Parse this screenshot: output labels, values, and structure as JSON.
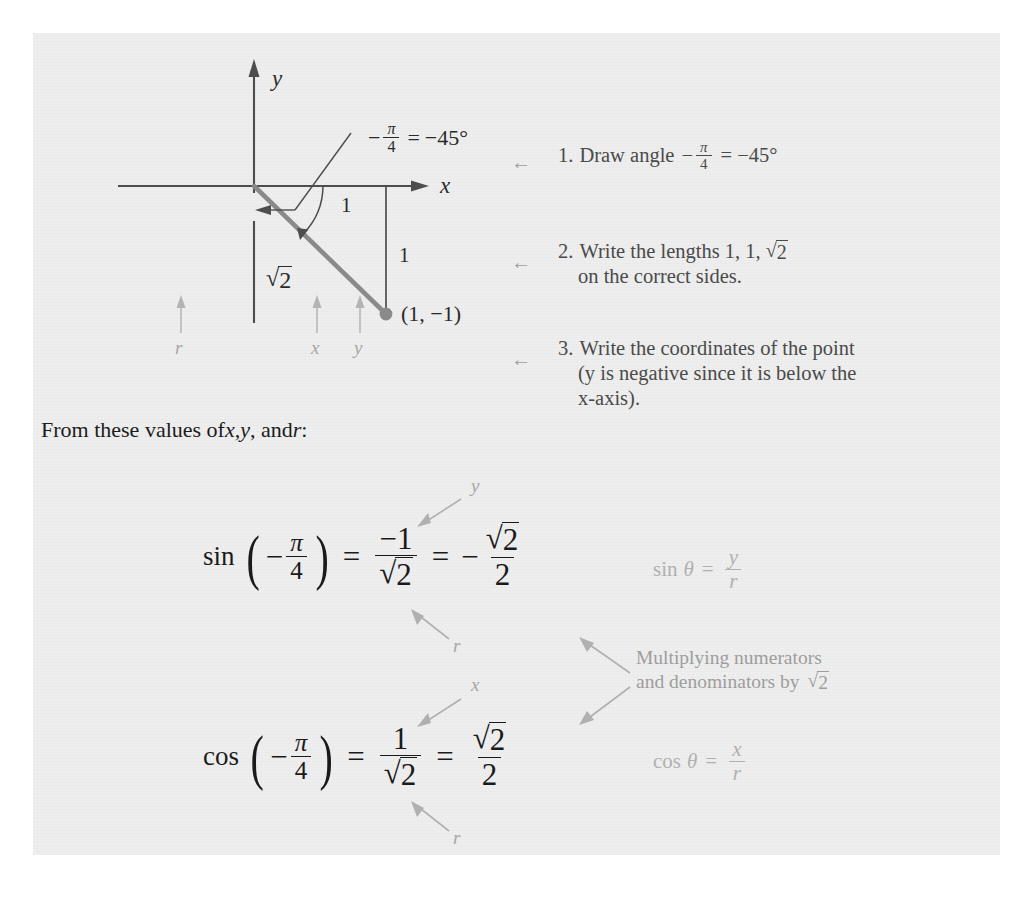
{
  "page": {
    "background_color": "#eeeeee",
    "ink_color": "#1c1c1c",
    "accent_gray": "#9d9d9d",
    "ray_color": "#8a8a8a"
  },
  "figure": {
    "axis_label_y": "y",
    "axis_label_x": "x",
    "angle_label": {
      "minus": "−",
      "numerator": "π",
      "denominator": "4",
      "equals": "=",
      "degrees": "−45°"
    },
    "side_label_top": "1",
    "side_label_right": "1",
    "hypotenuse_label": {
      "radical": "√",
      "radicand": "2"
    },
    "point_label": "(1, −1)",
    "component_labels": {
      "r": "r",
      "x": "x",
      "y": "y"
    }
  },
  "steps": [
    {
      "number": "1.",
      "text_before": "Draw angle",
      "has_fraction": true,
      "fraction": {
        "minus": "−",
        "numerator": "π",
        "denominator": "4"
      },
      "text_after": "= −45°",
      "line2": "",
      "arrow": "←"
    },
    {
      "number": "2.",
      "text_before": "Write the lengths 1, 1,",
      "has_fraction": false,
      "radical": {
        "radical": "√",
        "radicand": "2"
      },
      "text_after": "",
      "line2": "on the correct sides.",
      "arrow": "←"
    },
    {
      "number": "3.",
      "text_before": "Write the coordinates of the point",
      "has_fraction": false,
      "text_after": "",
      "line2": "(y is negative since it is below the",
      "line3": "x-axis).",
      "arrow": "←"
    }
  ],
  "lead_in_sentence": {
    "part1": "From these values of ",
    "var1": "x",
    "sep1": ", ",
    "var2": "y",
    "sep2": ", and ",
    "var3": "r",
    "part2": ":"
  },
  "equations": [
    {
      "id": "sine",
      "function": "sin",
      "open_paren": "(",
      "arg": {
        "minus": "−",
        "numerator": "π",
        "denominator": "4"
      },
      "close_paren": ")",
      "equals1": "=",
      "middle": {
        "numerator": "−1",
        "denominator_radical": "√",
        "denominator_radicand": "2"
      },
      "equals2": "=",
      "result": {
        "sign": "−",
        "numerator_radical": "√",
        "numerator_radicand": "2",
        "denominator": "2"
      },
      "callout_numerator": "y",
      "callout_denominator": "r",
      "identity": {
        "function": "sin",
        "theta": "θ",
        "equals": "=",
        "numerator": "y",
        "denominator": "r"
      }
    },
    {
      "id": "cosine",
      "function": "cos",
      "open_paren": "(",
      "arg": {
        "minus": "−",
        "numerator": "π",
        "denominator": "4"
      },
      "close_paren": ")",
      "equals1": "=",
      "middle": {
        "numerator": "1",
        "denominator_radical": "√",
        "denominator_radicand": "2"
      },
      "equals2": "=",
      "result": {
        "sign": "",
        "numerator_radical": "√",
        "numerator_radicand": "2",
        "denominator": "2"
      },
      "callout_numerator": "x",
      "callout_denominator": "r",
      "identity": {
        "function": "cos",
        "theta": "θ",
        "equals": "=",
        "numerator": "x",
        "denominator": "r"
      }
    }
  ],
  "side_note": {
    "line1": "Multiplying numerators",
    "line2_prefix": "and denominators by",
    "line2_radical": "√",
    "line2_radicand": "2"
  }
}
